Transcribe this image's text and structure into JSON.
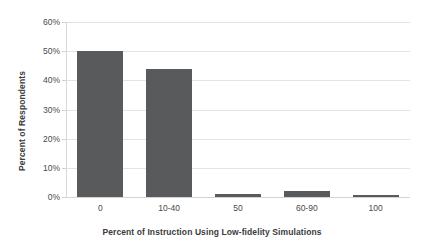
{
  "chart_data": {
    "type": "bar",
    "title": "",
    "categories": [
      "0",
      "10-40",
      "50",
      "60-90",
      "100"
    ],
    "values": [
      50,
      44,
      1,
      2,
      0.7
    ],
    "series": [
      {
        "name": "Percent of Respondents",
        "values": [
          50,
          44,
          1,
          2,
          0.7
        ]
      }
    ],
    "xlabel": "Percent of Instruction Using Low-fidelity Simulations",
    "ylabel": "Percent of Respondents",
    "ylim": [
      0,
      60
    ],
    "ytick_values": [
      0,
      10,
      20,
      30,
      40,
      50,
      60
    ],
    "ytick_labels": [
      "0%",
      "10%",
      "20%",
      "30%",
      "40%",
      "50%",
      "60%"
    ],
    "grid": true,
    "legend": false,
    "bar_color": "#595a5c",
    "gridline_color": "#e3e3e3",
    "background_color": "#ffffff"
  }
}
